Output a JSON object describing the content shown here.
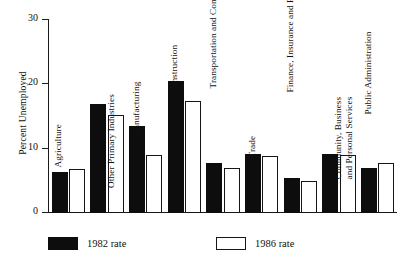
{
  "chart_data": {
    "type": "bar",
    "title": "",
    "xlabel": "",
    "ylabel": "Percent Unemployed",
    "ylim": [
      0,
      30
    ],
    "yticks": [
      0,
      10,
      20,
      30
    ],
    "ytick_labels": [
      "0",
      "10",
      "20",
      "30"
    ],
    "grid": false,
    "legend_position": "bottom-left",
    "categories": [
      "Agriculture",
      "Other Primary Industries",
      "Manufacturing",
      "Construction",
      "Transportation and Communication",
      "Trade",
      "Finance, Insurance and Real Estate",
      "Community, Business and Personal Services",
      "Public Administration"
    ],
    "series": [
      {
        "name": "1982 rate",
        "color": "#0d0d0d",
        "values": [
          6.3,
          17.0,
          13.5,
          20.5,
          7.7,
          9.1,
          5.4,
          9.1,
          7.0
        ]
      },
      {
        "name": "1986 rate",
        "color": "#ffffff",
        "values": [
          6.8,
          15.3,
          9.0,
          17.4,
          7.0,
          8.8,
          4.9,
          9.0,
          7.7
        ]
      }
    ]
  },
  "legend": {
    "items": [
      {
        "label": "1982 rate",
        "style": "filled"
      },
      {
        "label": "1986 rate",
        "style": "hollow"
      }
    ]
  }
}
